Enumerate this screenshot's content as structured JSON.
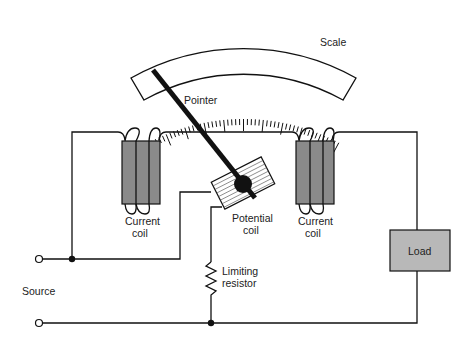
{
  "diagram": {
    "labels": {
      "scale": "Scale",
      "pointer": "Pointer",
      "current_coil_left_1": "Current",
      "current_coil_left_2": "coil",
      "potential_coil_1": "Potential",
      "potential_coil_2": "coil",
      "current_coil_right_1": "Current",
      "current_coil_right_2": "coil",
      "load": "Load",
      "limiting_resistor_1": "Limiting",
      "limiting_resistor_2": "resistor",
      "source": "Source"
    },
    "colors": {
      "coil_fill": "#8a8a8a",
      "load_fill": "#b8b8b8",
      "line": "#111111",
      "background": "#ffffff"
    },
    "components": [
      "scale",
      "pointer",
      "current-coil-left",
      "potential-coil",
      "current-coil-right",
      "load",
      "limiting-resistor",
      "source-terminals"
    ]
  }
}
